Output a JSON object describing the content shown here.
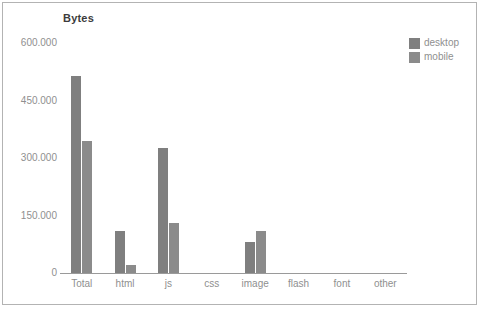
{
  "title": "Bytes",
  "legend": {
    "position": "top-right",
    "items": [
      {
        "label": "desktop",
        "color": "#7f7f7f"
      },
      {
        "label": "mobile",
        "color": "#8b8b8b"
      }
    ]
  },
  "chart_data": {
    "type": "bar",
    "title": "Bytes",
    "categories": [
      "Total",
      "html",
      "js",
      "css",
      "image",
      "flash",
      "font",
      "other"
    ],
    "series": [
      {
        "name": "desktop",
        "color": "#7f7f7f",
        "values": [
          515000,
          110000,
          325000,
          0,
          80000,
          0,
          0,
          0
        ]
      },
      {
        "name": "mobile",
        "color": "#8b8b8b",
        "values": [
          345000,
          20000,
          130000,
          0,
          110000,
          0,
          0,
          0
        ]
      }
    ],
    "xlabel": "",
    "ylabel": "Bytes",
    "ylim": [
      0,
      600000
    ],
    "yticks": [
      {
        "value": 0,
        "label": "0"
      },
      {
        "value": 150000,
        "label": "150.000"
      },
      {
        "value": 300000,
        "label": "300.000"
      },
      {
        "value": 450000,
        "label": "450.000"
      },
      {
        "value": 600000,
        "label": "600.000"
      }
    ],
    "grid": false,
    "legend_position": "top-right"
  }
}
